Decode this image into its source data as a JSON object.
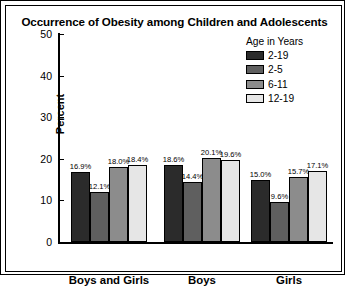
{
  "chart_data": {
    "type": "bar",
    "title": "Occurrence of Obesity among Children and Adolescents",
    "xlabel": "",
    "ylabel": "Percent",
    "ylim": [
      0,
      50
    ],
    "yticks": [
      "0",
      "10",
      "20",
      "30",
      "40",
      "50"
    ],
    "grid": false,
    "legend_position": "top-right",
    "legend_title": "Age in Years",
    "categories": [
      "Boys and Girls",
      "Boys",
      "Girls"
    ],
    "series": [
      {
        "name": "2-19",
        "color": "#2b2b2b",
        "values": [
          16.9,
          18.6,
          15.0
        ],
        "labels": [
          "16.9%",
          "18.6%",
          "15.0%"
        ]
      },
      {
        "name": "2-5",
        "color": "#5f5f5f",
        "values": [
          12.1,
          14.4,
          9.6
        ],
        "labels": [
          "12.1%",
          "14.4%",
          "9.6%"
        ]
      },
      {
        "name": "6-11",
        "color": "#8c8c8c",
        "values": [
          18.0,
          20.1,
          15.7
        ],
        "labels": [
          "18.0%",
          "20.1%",
          "15.7%"
        ]
      },
      {
        "name": "12-19",
        "color": "#e6e6e6",
        "values": [
          18.4,
          19.6,
          17.1
        ],
        "labels": [
          "18.4%",
          "19.6%",
          "17.1%"
        ]
      }
    ]
  },
  "axis": {
    "y_ticks": [
      {
        "label": "50",
        "value": 50
      },
      {
        "label": "40",
        "value": 40
      },
      {
        "label": "30",
        "value": 30
      },
      {
        "label": "20",
        "value": 20
      },
      {
        "label": "10",
        "value": 10
      },
      {
        "label": "0",
        "value": 0
      }
    ]
  }
}
